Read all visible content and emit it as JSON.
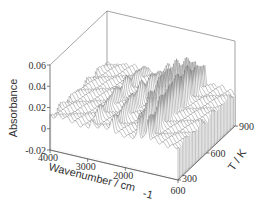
{
  "chart_data": {
    "type": "waterfall-3d",
    "title": "",
    "xlabel": "Wavenumber / cm-1",
    "ylabel": "T / K",
    "zlabel": "Absorbance",
    "x_ticks": [
      "4000",
      "3000",
      "2000",
      "600"
    ],
    "x_tick_values": [
      4000,
      3000,
      2000,
      600
    ],
    "y_ticks": [
      "300",
      "600",
      "900"
    ],
    "y_tick_values": [
      300,
      600,
      900
    ],
    "z_ticks": [
      "0.06",
      "0.04",
      "0.02",
      "0",
      "-0.02"
    ],
    "z_tick_values": [
      0.06,
      0.04,
      0.02,
      0,
      -0.02
    ],
    "xlim": [
      4000,
      600
    ],
    "ylim": [
      300,
      900
    ],
    "zlim": [
      -0.02,
      0.06
    ],
    "grid": false,
    "legend": "none",
    "series_description": "Stack of IR absorbance spectra across temperature; baseline near 0.01-0.02, sharp peaks near ~1600 and ~1400 cm-1 reaching ~0.04-0.05, smaller peaks near ~2900 and ~2300 cm-1",
    "peaks": [
      {
        "wavenumber": 2900,
        "absorbance": 0.025
      },
      {
        "wavenumber": 2350,
        "absorbance": 0.03
      },
      {
        "wavenumber": 1650,
        "absorbance": 0.05
      },
      {
        "wavenumber": 1400,
        "absorbance": 0.045
      }
    ],
    "n_traces": 40
  },
  "labels": {
    "zlabel": "Absorbance",
    "xlabel_main": "Wavenumber / cm",
    "xlabel_sub": "-1",
    "ylabel": "T / K"
  }
}
